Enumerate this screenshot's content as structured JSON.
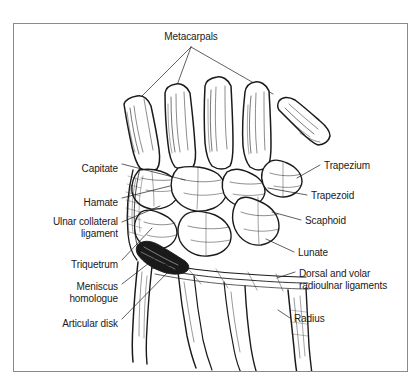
{
  "figure": {
    "title": "Metacarpals",
    "frame_color": "#8a8a8a",
    "ink_color": "#1a1a1a",
    "background": "#ffffff"
  },
  "labels": {
    "top": [
      {
        "id": "metacarpals",
        "text": "Metacarpals",
        "align": "center",
        "x": 191,
        "y": 31
      }
    ],
    "left": [
      {
        "id": "capitate",
        "text": "Capitate",
        "align": "right",
        "x": 118,
        "y": 163
      },
      {
        "id": "hamate",
        "text": "Hamate",
        "align": "right",
        "x": 118,
        "y": 197
      },
      {
        "id": "ulnar-collateral-ligament",
        "text": "Ulnar collateral\nligament",
        "align": "right",
        "x": 118,
        "y": 216
      },
      {
        "id": "triquetrum",
        "text": "Triquetrum",
        "align": "right",
        "x": 118,
        "y": 259
      },
      {
        "id": "meniscus-homologue",
        "text": "Meniscus\nhomologue",
        "align": "right",
        "x": 118,
        "y": 281
      },
      {
        "id": "articular-disk",
        "text": "Articular disk",
        "align": "right",
        "x": 118,
        "y": 318
      }
    ],
    "right": [
      {
        "id": "trapezium",
        "text": "Trapezium",
        "align": "left",
        "x": 324,
        "y": 164
      },
      {
        "id": "trapezoid",
        "text": "Trapezoid",
        "align": "left",
        "x": 311,
        "y": 194
      },
      {
        "id": "scaphoid",
        "text": "Scaphoid",
        "align": "left",
        "x": 305,
        "y": 219
      },
      {
        "id": "lunate",
        "text": "Lunate",
        "align": "left",
        "x": 298,
        "y": 251
      },
      {
        "id": "dorsal-volar-radioulnar-ligaments",
        "text": "Dorsal and volar\nradioulnar ligaments",
        "align": "left",
        "x": 299,
        "y": 274
      },
      {
        "id": "radius",
        "text": "Radius",
        "align": "left",
        "x": 294,
        "y": 317
      }
    ]
  },
  "leader_lines": {
    "metacarpals_fan_origin": {
      "x": 191,
      "y": 47
    },
    "metacarpals_targets": [
      {
        "x": 128,
        "y": 110
      },
      {
        "x": 173,
        "y": 95
      },
      {
        "x": 273,
        "y": 93
      }
    ]
  }
}
